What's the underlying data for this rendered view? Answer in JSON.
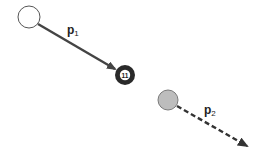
{
  "diagram": {
    "type": "billiard-collision",
    "labels": {
      "p1_main": "p",
      "p1_sub": "1",
      "p2_main": "p",
      "p2_sub": "2"
    },
    "balls": [
      {
        "name": "cue-ball",
        "fill": "#ffffff",
        "stroke": "#555555"
      },
      {
        "name": "eleven-ball",
        "number": "11",
        "fill": "#222222"
      },
      {
        "name": "target-ball",
        "fill": "#b8b8b8",
        "stroke": "#777777"
      }
    ],
    "arrows": [
      {
        "name": "momentum-p1",
        "style": "solid",
        "color": "#444444"
      },
      {
        "name": "momentum-p2",
        "style": "dashed",
        "color": "#333333"
      }
    ],
    "ball_number": "11"
  }
}
